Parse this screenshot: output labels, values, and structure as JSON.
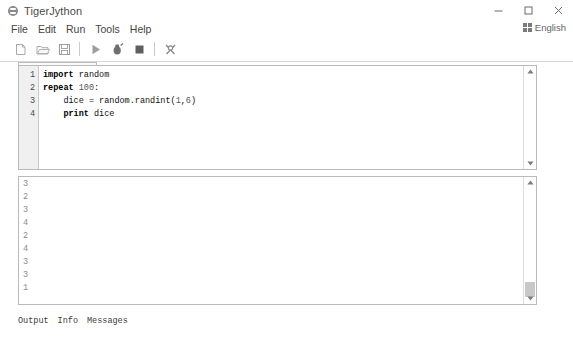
{
  "window": {
    "title": "TigerJython",
    "app_icon": "tiger-icon",
    "controls": [
      {
        "name": "minimize",
        "glyph": "minimize-icon"
      },
      {
        "name": "maximize",
        "glyph": "maximize-icon"
      },
      {
        "name": "close",
        "glyph": "close-icon"
      }
    ]
  },
  "menubar": {
    "items": [
      {
        "label": "File"
      },
      {
        "label": "Edit"
      },
      {
        "label": "Run"
      },
      {
        "label": "Tools"
      },
      {
        "label": "Help"
      }
    ]
  },
  "language": {
    "label": "English",
    "icon": "keyboard-grid-icon"
  },
  "toolbar": {
    "items": [
      {
        "name": "new-file-button",
        "icon": "new-document-icon"
      },
      {
        "name": "open-file-button",
        "icon": "open-folder-icon"
      },
      {
        "name": "save-file-button",
        "icon": "floppy-save-icon"
      },
      {
        "name": "run-button",
        "icon": "play-icon"
      },
      {
        "name": "debug-button",
        "icon": "bug-icon"
      },
      {
        "name": "stop-button",
        "icon": "stop-square-icon"
      },
      {
        "name": "tools-button",
        "icon": "wrench-tools-icon"
      }
    ]
  },
  "editor": {
    "tab": {
      "label": "untitled 1*",
      "close_glyph": "✕"
    },
    "line_numbers": [
      "1",
      "2",
      "3",
      "4"
    ],
    "lines": [
      {
        "segments": [
          {
            "text": "import",
            "style": "kw"
          },
          {
            "text": " random",
            "style": "plain"
          }
        ]
      },
      {
        "segments": [
          {
            "text": "repeat",
            "style": "kw"
          },
          {
            "text": " ",
            "style": "plain"
          },
          {
            "text": "100",
            "style": "num"
          },
          {
            "text": ":",
            "style": "plain"
          }
        ]
      },
      {
        "segments": [
          {
            "text": "    dice = random.randint(",
            "style": "plain"
          },
          {
            "text": "1",
            "style": "num"
          },
          {
            "text": ",",
            "style": "plain"
          },
          {
            "text": "6",
            "style": "num"
          },
          {
            "text": ")",
            "style": "plain"
          }
        ]
      },
      {
        "segments": [
          {
            "text": "    ",
            "style": "plain"
          },
          {
            "text": "print",
            "style": "kw"
          },
          {
            "text": " dice",
            "style": "plain"
          }
        ]
      }
    ]
  },
  "output": {
    "lines": [
      "3",
      "2",
      "3",
      "4",
      "2",
      "4",
      "3",
      "3",
      "1"
    ]
  },
  "bottom_tabs": [
    {
      "label": "Output"
    },
    {
      "label": "Info"
    },
    {
      "label": "Messages"
    }
  ],
  "colors": {
    "background": "#ffffff",
    "panel_border": "#b9b9b9",
    "gutter": "#f0f0f0",
    "text": "#3c3c3c",
    "output_text": "#8d8d8d",
    "scroll_thumb": "#c8c8c8"
  }
}
